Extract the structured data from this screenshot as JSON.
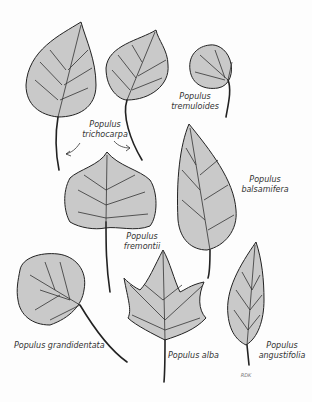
{
  "figure": {
    "labels": {
      "trichocarpa": {
        "genus": "Populus",
        "species": "trichocarpa"
      },
      "tremuloides": {
        "genus": "Populus",
        "species": "tremuloides"
      },
      "balsamifera": {
        "genus": "Populus",
        "species": "balsamifera"
      },
      "fremontii": {
        "genus": "Populus",
        "species": "fremontii"
      },
      "grandidentata": {
        "full": "Populus grandidentata"
      },
      "alba": {
        "full": "Populus alba"
      },
      "angustifolia": {
        "genus": "Populus",
        "species": "angustifolia"
      }
    },
    "signature": "RDK"
  }
}
